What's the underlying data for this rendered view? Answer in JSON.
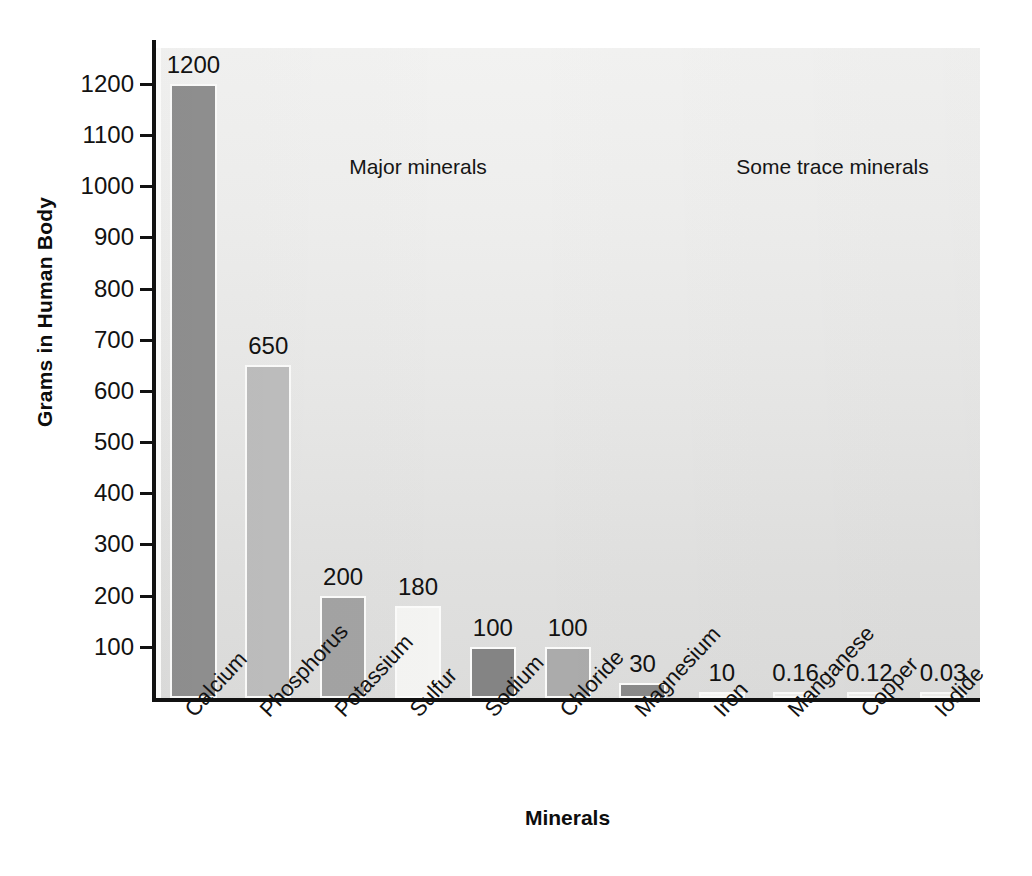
{
  "chart_data": {
    "type": "bar",
    "title": "",
    "xlabel": "Minerals",
    "ylabel": "Grams in Human Body",
    "categories": [
      "Calcium",
      "Phosphorus",
      "Potassium",
      "Sulfur",
      "Sodium",
      "Chloride",
      "Magnesium",
      "Iron",
      "Manganese",
      "Copper",
      "Iodide"
    ],
    "values": [
      1200,
      650,
      200,
      180,
      100,
      100,
      30,
      10,
      0.16,
      0.12,
      0.03
    ],
    "value_labels": [
      "1200",
      "650",
      "200",
      "180",
      "100",
      "100",
      "30",
      "10",
      "0.16",
      "0.12",
      "0.03"
    ],
    "bar_colors": [
      "#8f8f8f",
      "#bdbdbd",
      "#a3a3a3",
      "#f4f4f2",
      "#848484",
      "#ababab",
      "#8a8a8a",
      "#f6f6f4",
      "#eeeeec",
      "#eeeeec",
      "#eeeeec"
    ],
    "ylim": [
      0,
      1270
    ],
    "yticks": [
      100,
      200,
      300,
      400,
      500,
      600,
      700,
      800,
      900,
      1000,
      1100,
      1200
    ],
    "ytick_labels": [
      "100",
      "200",
      "300",
      "400",
      "500",
      "600",
      "700",
      "800",
      "900",
      "1000",
      "1100",
      "1200"
    ],
    "grid": false,
    "legend": "none",
    "groups": [
      {
        "label": "Major minerals",
        "members": [
          "Calcium",
          "Phosphorus",
          "Potassium",
          "Sulfur",
          "Sodium",
          "Chloride",
          "Magnesium"
        ]
      },
      {
        "label": "Some trace minerals",
        "members": [
          "Iron",
          "Manganese",
          "Copper",
          "Iodide"
        ]
      }
    ],
    "annotations": [
      {
        "text": "Major minerals",
        "position": "top-left-section"
      },
      {
        "text": "Some trace minerals",
        "position": "top-right-section"
      }
    ],
    "colors": {
      "axis": "#111111",
      "text": "#121212",
      "plot_background": "#eaeae9",
      "divider": "#fdfdfc",
      "bar_outline": "#fbfbfa"
    }
  }
}
